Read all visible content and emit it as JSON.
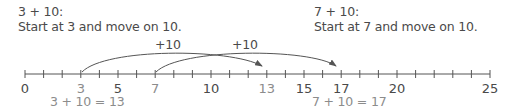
{
  "left_problem": {
    "heading": "3 + 10:",
    "instruction": "Start at 3 and move on 10.",
    "jump_label": "+10",
    "result": "3 + 10 = 13",
    "start": 3,
    "end": 13
  },
  "right_problem": {
    "heading": "7 + 10:",
    "instruction": "Start at 7 and move on 10.",
    "jump_label": "+10",
    "result": "7 + 10 = 17",
    "start": 7,
    "end": 17
  },
  "number_line": {
    "min": 0,
    "max": 25,
    "step": 1,
    "labels": [
      {
        "value": "0",
        "pos": 0,
        "color": "dark"
      },
      {
        "value": "3",
        "pos": 3,
        "color": "gray"
      },
      {
        "value": "5",
        "pos": 5,
        "color": "dark"
      },
      {
        "value": "7",
        "pos": 7,
        "color": "gray"
      },
      {
        "value": "10",
        "pos": 10,
        "color": "dark"
      },
      {
        "value": "13",
        "pos": 13,
        "color": "gray"
      },
      {
        "value": "15",
        "pos": 15,
        "color": "dark"
      },
      {
        "value": "17",
        "pos": 17,
        "color": "dark"
      },
      {
        "value": "20",
        "pos": 20,
        "color": "dark"
      },
      {
        "value": "25",
        "pos": 25,
        "color": "dark"
      }
    ]
  },
  "colors": {
    "text_dark": "#4a4a4a",
    "text_gray": "#8c8c8c",
    "line": "#555555"
  }
}
